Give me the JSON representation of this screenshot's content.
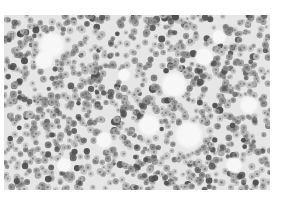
{
  "image": {
    "description": "Grayscale micrograph of densely packed round cells (histology section) with scattered pale/white gaps",
    "caption": "Densely packed round cell micrograph",
    "colors": {
      "background": "#ffffff",
      "stroma": "#e6e6e6",
      "cell_light": "#b8b8b8",
      "cell_mid": "#8c8c8c",
      "cell_dark": "#4a4a4a",
      "gap": "#f7f7f7"
    },
    "tissue_bounds": {
      "left": 4,
      "top": 15,
      "width": 266,
      "height": 175
    },
    "cell_radius_px": [
      2.2,
      3.6
    ],
    "cell_count": 1300,
    "gaps": [
      [
        48,
        30,
        14
      ],
      [
        40,
        45,
        10
      ],
      [
        170,
        70,
        14
      ],
      [
        200,
        42,
        10
      ],
      [
        145,
        110,
        12
      ],
      [
        185,
        120,
        15
      ],
      [
        100,
        125,
        9
      ],
      [
        245,
        90,
        10
      ],
      [
        230,
        150,
        9
      ],
      [
        60,
        150,
        8
      ],
      [
        120,
        60,
        7
      ],
      [
        215,
        22,
        8
      ]
    ],
    "seed": 7
  }
}
